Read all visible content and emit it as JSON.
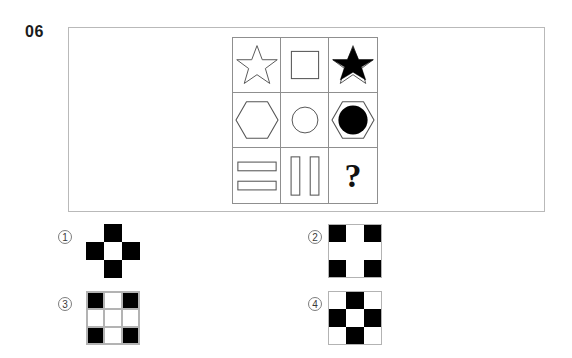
{
  "question": {
    "number": "06",
    "unknown_marker": "?"
  },
  "matrix": {
    "rows": 3,
    "columns": 3,
    "cells": [
      {
        "id": "r1c1",
        "shape": "star",
        "style": "outline",
        "label": "star-outline"
      },
      {
        "id": "r1c2",
        "shape": "square",
        "style": "outline",
        "label": "square-outline"
      },
      {
        "id": "r1c3",
        "shape": "star-with-filled-star",
        "style": "outline-plus-filled",
        "label": "star-outline-with-black-star"
      },
      {
        "id": "r2c1",
        "shape": "hexagon",
        "style": "outline",
        "label": "hexagon-outline"
      },
      {
        "id": "r2c2",
        "shape": "circle",
        "style": "outline",
        "label": "circle-outline"
      },
      {
        "id": "r2c3",
        "shape": "hexagon-with-filled-circle",
        "style": "outline-plus-filled",
        "label": "hexagon-outline-with-black-circle"
      },
      {
        "id": "r3c1",
        "shape": "two-horizontal-bars",
        "style": "outline",
        "label": "two-horizontal-rectangles"
      },
      {
        "id": "r3c2",
        "shape": "two-vertical-bars",
        "style": "outline",
        "label": "two-vertical-rectangles"
      },
      {
        "id": "r3c3",
        "shape": "question-mark",
        "style": "text",
        "label": "missing-answer"
      }
    ]
  },
  "options": [
    {
      "key": "1",
      "number": "①",
      "name": "option-1",
      "pattern": "plus-cross",
      "has_gridlines": false,
      "has_frame": false,
      "fill_map": [
        [
          "white",
          "black",
          "white"
        ],
        [
          "black",
          "white",
          "black"
        ],
        [
          "white",
          "black",
          "white"
        ]
      ]
    },
    {
      "key": "2",
      "number": "②",
      "name": "option-2",
      "pattern": "corners-filled",
      "has_gridlines": false,
      "has_frame": true,
      "fill_map": [
        [
          "black",
          "white",
          "black"
        ],
        [
          "white",
          "white",
          "white"
        ],
        [
          "black",
          "white",
          "black"
        ]
      ]
    },
    {
      "key": "3",
      "number": "③",
      "name": "option-3",
      "pattern": "corners-filled-with-gridlines",
      "has_gridlines": true,
      "has_frame": true,
      "fill_map": [
        [
          "black",
          "white",
          "black"
        ],
        [
          "white",
          "white",
          "white"
        ],
        [
          "black",
          "white",
          "black"
        ]
      ]
    },
    {
      "key": "4",
      "number": "④",
      "name": "option-4",
      "pattern": "plus-cross-with-frame",
      "has_gridlines": false,
      "has_frame": true,
      "fill_map": [
        [
          "white",
          "black",
          "white"
        ],
        [
          "black",
          "white",
          "black"
        ],
        [
          "white",
          "black",
          "white"
        ]
      ]
    }
  ],
  "colors": {
    "fill_black": "#000000",
    "fill_white": "#ffffff",
    "grid_stroke": "#8f8f8f",
    "frame_stroke": "#b9b9b9",
    "text": "#1b1b1b"
  }
}
